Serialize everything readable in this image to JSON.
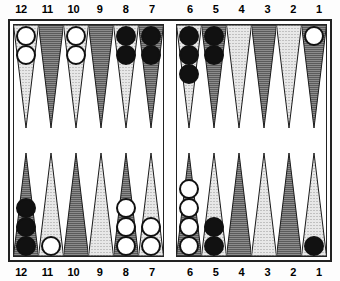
{
  "app": {
    "title": "Backgammon Board Diagram",
    "board_label": "backgammon-board"
  },
  "colors": {
    "checker_white": "#ffffff",
    "checker_black": "#111111",
    "point_light": "#e8e8e8",
    "point_dark": "#8c8c8c",
    "frame": "#222222",
    "background": "#ffffff"
  },
  "labels": {
    "top": [
      "12",
      "11",
      "10",
      "9",
      "8",
      "7",
      "6",
      "5",
      "4",
      "3",
      "2",
      "1"
    ],
    "bottom": [
      "12",
      "11",
      "10",
      "9",
      "8",
      "7",
      "6",
      "5",
      "4",
      "3",
      "2",
      "1"
    ]
  },
  "board": {
    "top_left": [
      {
        "point": "12",
        "shade": "light",
        "checkers": 2,
        "color": "white"
      },
      {
        "point": "11",
        "shade": "dark",
        "checkers": 0,
        "color": "none"
      },
      {
        "point": "10",
        "shade": "light",
        "checkers": 2,
        "color": "white"
      },
      {
        "point": "9",
        "shade": "dark",
        "checkers": 0,
        "color": "none"
      },
      {
        "point": "8",
        "shade": "light",
        "checkers": 2,
        "color": "black"
      },
      {
        "point": "7",
        "shade": "dark",
        "checkers": 2,
        "color": "black"
      }
    ],
    "top_right": [
      {
        "point": "6",
        "shade": "light",
        "checkers": 3,
        "color": "black"
      },
      {
        "point": "5",
        "shade": "dark",
        "checkers": 2,
        "color": "black"
      },
      {
        "point": "4",
        "shade": "light",
        "checkers": 0,
        "color": "none"
      },
      {
        "point": "3",
        "shade": "dark",
        "checkers": 0,
        "color": "none"
      },
      {
        "point": "2",
        "shade": "light",
        "checkers": 0,
        "color": "none"
      },
      {
        "point": "1",
        "shade": "dark",
        "checkers": 1,
        "color": "white"
      }
    ],
    "bottom_left": [
      {
        "point": "12",
        "shade": "dark",
        "checkers": 3,
        "color": "black"
      },
      {
        "point": "11",
        "shade": "light",
        "checkers": 1,
        "color": "white"
      },
      {
        "point": "10",
        "shade": "dark",
        "checkers": 0,
        "color": "none"
      },
      {
        "point": "9",
        "shade": "light",
        "checkers": 0,
        "color": "none"
      },
      {
        "point": "8",
        "shade": "dark",
        "checkers": 3,
        "color": "white"
      },
      {
        "point": "7",
        "shade": "light",
        "checkers": 2,
        "color": "white"
      }
    ],
    "bottom_right": [
      {
        "point": "6",
        "shade": "dark",
        "checkers": 4,
        "color": "white"
      },
      {
        "point": "5",
        "shade": "light",
        "checkers": 2,
        "color": "black"
      },
      {
        "point": "4",
        "shade": "dark",
        "checkers": 0,
        "color": "none"
      },
      {
        "point": "3",
        "shade": "light",
        "checkers": 0,
        "color": "none"
      },
      {
        "point": "2",
        "shade": "dark",
        "checkers": 0,
        "color": "none"
      },
      {
        "point": "1",
        "shade": "light",
        "checkers": 1,
        "color": "black"
      }
    ],
    "bar": {
      "white_on_bar": 0,
      "black_on_bar": 0
    }
  }
}
